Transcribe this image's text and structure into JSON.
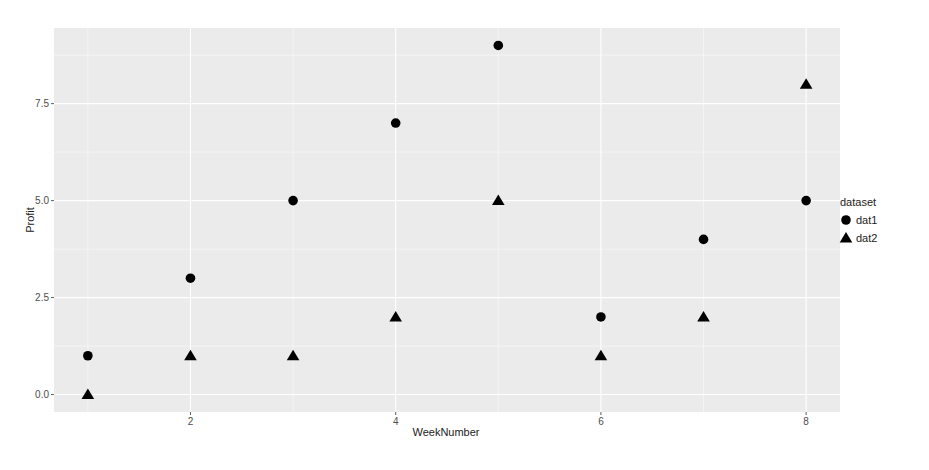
{
  "chart_data": {
    "type": "scatter",
    "title": "",
    "xlabel": "WeekNumber",
    "ylabel": "Profit",
    "x": [
      1,
      2,
      3,
      4,
      5,
      6,
      7,
      8
    ],
    "series": [
      {
        "name": "dat1",
        "shape": "circle",
        "values": [
          1,
          3,
          5,
          7,
          9,
          2,
          4,
          5
        ]
      },
      {
        "name": "dat2",
        "shape": "triangle",
        "values": [
          0,
          1,
          1,
          2,
          5,
          1,
          2,
          8
        ]
      }
    ],
    "xticks": [
      2,
      4,
      6,
      8
    ],
    "xtick_labels": [
      "2",
      "4",
      "6",
      "8"
    ],
    "yticks": [
      0,
      2.5,
      5,
      7.5
    ],
    "ytick_labels": [
      "0.0",
      "2.5",
      "5.0",
      "7.5"
    ],
    "xlim": [
      0.67,
      8.33
    ],
    "ylim": [
      -0.45,
      9.45
    ],
    "grid": true,
    "legend": {
      "title": "dataset",
      "position": "right",
      "entries": [
        "dat1",
        "dat2"
      ]
    },
    "colors": {
      "panel_bg": "#ebebeb",
      "grid": "#ffffff",
      "point": "#000000"
    }
  }
}
